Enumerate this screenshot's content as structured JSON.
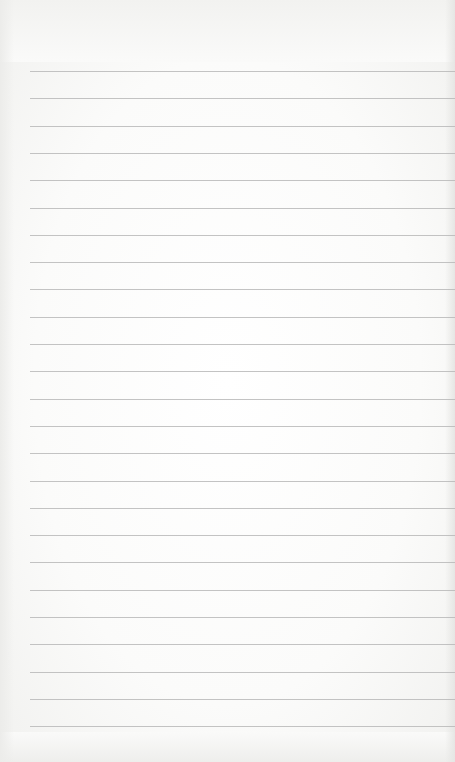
{
  "page": {
    "type": "lined-paper",
    "background_color": "#fbfbfa",
    "rule_color": "#b9b9b9",
    "rule_count": 25,
    "rule_left": 30,
    "first_rule_y": 71,
    "rule_spacing": 27.3,
    "content_text": ""
  }
}
